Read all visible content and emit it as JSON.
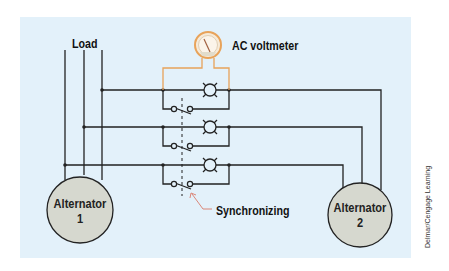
{
  "diagram": {
    "title": "",
    "labels": {
      "load": "Load",
      "voltmeter": "AC voltmeter",
      "synchronizing": "Synchronizing",
      "alternator1_name": "Alternator",
      "alternator1_num": "1",
      "alternator2_name": "Alternator",
      "alternator2_num": "2"
    },
    "credit": "Delmar/Cengage Learning",
    "nodes": [
      {
        "id": "alternator-1",
        "type": "generator",
        "label": "Alternator 1"
      },
      {
        "id": "alternator-2",
        "type": "generator",
        "label": "Alternator 2"
      },
      {
        "id": "ac-voltmeter",
        "type": "meter",
        "label": "AC voltmeter"
      },
      {
        "id": "lamp-1",
        "type": "lamp"
      },
      {
        "id": "lamp-2",
        "type": "lamp"
      },
      {
        "id": "lamp-3",
        "type": "lamp"
      },
      {
        "id": "sync-switch",
        "type": "three-pole switch",
        "label": "Synchronizing"
      },
      {
        "id": "load",
        "type": "load",
        "label": "Load"
      }
    ],
    "colors": {
      "background": "#e3f1fa",
      "wire": "#222222",
      "voltmeter_wire": "#e8a35a",
      "alternator_fill": "#d6d8cf",
      "pointer_arrow": "#d97a6a"
    }
  }
}
